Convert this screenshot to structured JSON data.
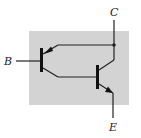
{
  "diagram": {
    "terminals": {
      "collector": "C",
      "base": "B",
      "emitter": "E"
    },
    "components": [
      {
        "id": "Q1",
        "type": "PNP transistor",
        "role": "input"
      },
      {
        "id": "Q2",
        "type": "NPN transistor",
        "role": "output"
      }
    ],
    "colors": {
      "package_fill": "#d3d3d3",
      "wire": "#222222",
      "background": "#ffffff"
    }
  }
}
